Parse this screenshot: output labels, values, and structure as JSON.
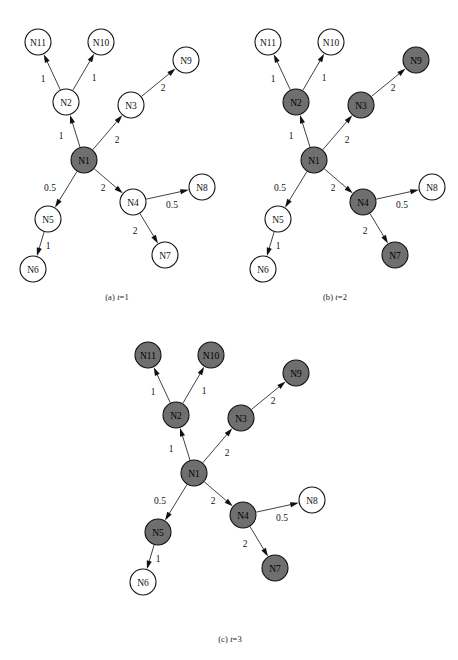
{
  "figure": {
    "type": "directed-graph-sequence",
    "node_radius": 13,
    "colors": {
      "node_filled": "#6f6f6f",
      "node_open": "#ffffff",
      "stroke": "#111111",
      "edge": "#2b2b2b",
      "background": "#ffffff"
    }
  },
  "graph": {
    "nodes": [
      {
        "id": "N1",
        "label": "N1",
        "x": 84,
        "y": 160
      },
      {
        "id": "N2",
        "label": "N2",
        "x": 66,
        "y": 102
      },
      {
        "id": "N3",
        "label": "N3",
        "x": 131,
        "y": 105
      },
      {
        "id": "N4",
        "label": "N4",
        "x": 133,
        "y": 202
      },
      {
        "id": "N5",
        "label": "N5",
        "x": 48,
        "y": 219
      },
      {
        "id": "N6",
        "label": "N6",
        "x": 33,
        "y": 269
      },
      {
        "id": "N7",
        "label": "N7",
        "x": 165,
        "y": 255
      },
      {
        "id": "N8",
        "label": "N8",
        "x": 202,
        "y": 187
      },
      {
        "id": "N9",
        "label": "N9",
        "x": 186,
        "y": 60
      },
      {
        "id": "N10",
        "label": "N10",
        "x": 101,
        "y": 42
      },
      {
        "id": "N11",
        "label": "N11",
        "x": 38,
        "y": 42
      }
    ],
    "edges": [
      {
        "from": "N1",
        "to": "N2",
        "weight": "1",
        "lx": 61,
        "ly": 136
      },
      {
        "from": "N1",
        "to": "N3",
        "weight": "2",
        "lx": 117,
        "ly": 140
      },
      {
        "from": "N1",
        "to": "N4",
        "weight": "2",
        "lx": 103,
        "ly": 188
      },
      {
        "from": "N1",
        "to": "N5",
        "weight": "0.5",
        "lx": 50,
        "ly": 188
      },
      {
        "from": "N2",
        "to": "N10",
        "weight": "1",
        "lx": 94,
        "ly": 78
      },
      {
        "from": "N2",
        "to": "N11",
        "weight": "1",
        "lx": 43,
        "ly": 79
      },
      {
        "from": "N3",
        "to": "N9",
        "weight": "2",
        "lx": 163,
        "ly": 88
      },
      {
        "from": "N4",
        "to": "N7",
        "weight": "2",
        "lx": 135,
        "ly": 231
      },
      {
        "from": "N4",
        "to": "N8",
        "weight": "0.5",
        "lx": 172,
        "ly": 205
      },
      {
        "from": "N5",
        "to": "N6",
        "weight": "1",
        "lx": 48,
        "ly": 246
      }
    ]
  },
  "panels": [
    {
      "key": "a",
      "caption_prefix": "(a) ",
      "caption_var": "t",
      "caption_suffix": "=1",
      "caption_full": "(a) t=1",
      "time_step": 1,
      "origin_x": 0,
      "origin_y": 0,
      "caption_x": 72,
      "caption_y": 292,
      "caption_width": 90,
      "filled_nodes": [
        "N1"
      ]
    },
    {
      "key": "b",
      "caption_prefix": "(b) ",
      "caption_var": "t",
      "caption_suffix": "=2",
      "caption_full": "(b) t=2",
      "time_step": 2,
      "origin_x": 230,
      "origin_y": 0,
      "caption_x": 290,
      "caption_y": 292,
      "caption_width": 90,
      "filled_nodes": [
        "N1",
        "N2",
        "N3",
        "N4",
        "N7",
        "N9"
      ]
    },
    {
      "key": "c",
      "caption_prefix": "(c) ",
      "caption_var": "t",
      "caption_suffix": "=3",
      "caption_full": "(c) t=3",
      "time_step": 3,
      "origin_x": 110,
      "origin_y": 313,
      "caption_x": 180,
      "caption_y": 634,
      "caption_width": 100,
      "filled_nodes": [
        "N1",
        "N2",
        "N3",
        "N4",
        "N5",
        "N7",
        "N9",
        "N10",
        "N11"
      ]
    }
  ]
}
